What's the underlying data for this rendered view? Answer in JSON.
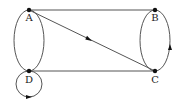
{
  "diagram": {
    "type": "directed-graph",
    "colors": {
      "edge": "#555555",
      "node": "#111111",
      "label": "#222222",
      "background": "#ffffff"
    },
    "nodes": [
      {
        "id": "A",
        "label": "A",
        "x": 29,
        "y": 10
      },
      {
        "id": "B",
        "label": "B",
        "x": 155,
        "y": 10
      },
      {
        "id": "C",
        "label": "C",
        "x": 155,
        "y": 71
      },
      {
        "id": "D",
        "label": "D",
        "x": 29,
        "y": 71
      }
    ],
    "edges": [
      {
        "from": "A",
        "to": "B",
        "shape": "straight",
        "arrow": false
      },
      {
        "from": "D",
        "to": "C",
        "shape": "straight",
        "arrow": false
      },
      {
        "from": "A",
        "to": "C",
        "shape": "straight",
        "arrow": "mid"
      },
      {
        "from": "A",
        "to": "D",
        "shape": "double-arc",
        "arrow": false
      },
      {
        "from": "B",
        "to": "C",
        "shape": "double-arc",
        "arrow": "right-arc-upward"
      },
      {
        "from": "D",
        "to": "D",
        "shape": "self-loop",
        "arrow": "bottom"
      }
    ]
  }
}
